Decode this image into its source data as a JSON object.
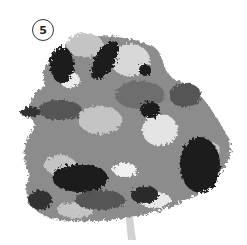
{
  "step_badge": {
    "number": "5"
  },
  "illustration": {
    "subject": "tree-canopy-grayscale-painting",
    "colors": {
      "dark": "#1a1a1a",
      "mid_dark": "#555555",
      "mid": "#8c8c8c",
      "light": "#c4c4c4",
      "highlight": "#ececec",
      "trunk": "#d2d2d2"
    }
  }
}
